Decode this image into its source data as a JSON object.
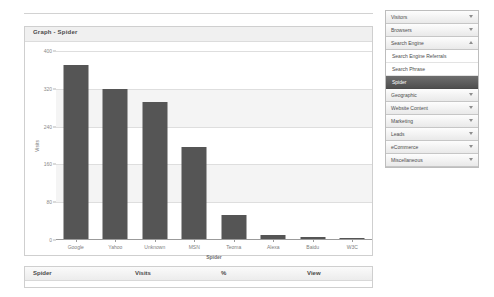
{
  "chart_panel": {
    "title": "Graph - Spider"
  },
  "chart_data": {
    "type": "bar",
    "title": "Graph - Spider",
    "xlabel": "Spider",
    "ylabel": "Visits",
    "categories": [
      "Google",
      "Yahoo",
      "Unknown",
      "MSN",
      "Teoma",
      "Alexa",
      "Baidu",
      "W3C"
    ],
    "values": [
      370,
      319,
      292,
      195,
      51,
      8,
      4,
      2
    ],
    "yticks": [
      0,
      80,
      160,
      240,
      320,
      400
    ],
    "ylim": [
      0,
      400
    ],
    "grid": true,
    "legend": "none",
    "series": [
      {
        "name": "Visits",
        "values": [
          370,
          319,
          292,
          195,
          51,
          8,
          4,
          2
        ]
      }
    ],
    "bar_color": "#555555"
  },
  "table": {
    "columns": [
      "Spider",
      "Visits",
      "%",
      "View"
    ],
    "rows": []
  },
  "sidebar": {
    "sections": [
      {
        "label": "Visitors",
        "expanded": false,
        "icon": "chevron-down-icon",
        "items": []
      },
      {
        "label": "Browsers",
        "expanded": false,
        "icon": "chevron-down-icon",
        "items": []
      },
      {
        "label": "Search Engine",
        "expanded": true,
        "icon": "chevron-up-icon",
        "items": [
          {
            "label": "Search Engine Referrals",
            "active": false
          },
          {
            "label": "Search Phrase",
            "active": false
          },
          {
            "label": "Spider",
            "active": true
          }
        ]
      },
      {
        "label": "Geographic",
        "expanded": false,
        "icon": "chevron-down-icon",
        "items": []
      },
      {
        "label": "Website Content",
        "expanded": false,
        "icon": "chevron-down-icon",
        "items": []
      },
      {
        "label": "Marketing",
        "expanded": false,
        "icon": "chevron-down-icon",
        "items": []
      },
      {
        "label": "Leads",
        "expanded": false,
        "icon": "chevron-down-icon",
        "items": []
      },
      {
        "label": "eCommerce",
        "expanded": false,
        "icon": "chevron-down-icon",
        "items": []
      },
      {
        "label": "Miscellaneous",
        "expanded": false,
        "icon": "chevron-down-icon",
        "items": []
      }
    ]
  },
  "colors": {
    "bar": "#555555",
    "panel_border": "#cfcfcf",
    "active_item": "#5a5a5a",
    "grid": "#dedede"
  }
}
